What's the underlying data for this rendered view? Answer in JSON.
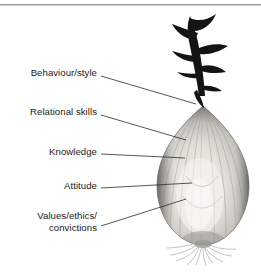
{
  "figure": {
    "background_color": "#ffffff",
    "rule_color": "#9a9a9a",
    "text_color": "#1b1b1b",
    "leader_color": "#2b2b2b"
  },
  "labels": [
    {
      "id": "behaviour-style",
      "text": "Behaviour/style",
      "right_px": 164,
      "top_px": 67,
      "leader": {
        "x1": 101,
        "y1": 76,
        "x2": 196,
        "y2": 104
      }
    },
    {
      "id": "relational-skills",
      "text": "Relational skills",
      "right_px": 164,
      "top_px": 106,
      "leader": {
        "x1": 101,
        "y1": 115,
        "x2": 186,
        "y2": 140
      }
    },
    {
      "id": "knowledge",
      "text": "Knowledge",
      "right_px": 164,
      "top_px": 146,
      "leader": {
        "x1": 101,
        "y1": 154,
        "x2": 185,
        "y2": 158
      }
    },
    {
      "id": "attitude",
      "text": "Attitude",
      "right_px": 164,
      "top_px": 180,
      "leader": {
        "x1": 101,
        "y1": 188,
        "x2": 192,
        "y2": 183
      }
    },
    {
      "id": "values-ethics-convictions",
      "text": "Values/ethics/\nconvictions",
      "right_px": 164,
      "top_px": 210,
      "leader": {
        "x1": 101,
        "y1": 226,
        "x2": 186,
        "y2": 199
      }
    }
  ],
  "onion": {
    "name": "onion-photo",
    "description": "Grayscale photograph of an onion bulb with dried dark stalk on top and wispy roots below",
    "bulb": {
      "cx": 203,
      "cy": 180,
      "rx": 46,
      "ry": 66
    },
    "stalk": {
      "x": 175,
      "y": 14,
      "width": 42,
      "height": 78,
      "color": "#141414"
    },
    "roots": {
      "x": 168,
      "y": 226,
      "width": 72,
      "height": 32,
      "color": "#b6b6b6"
    },
    "skin_light": "#e9e7e1",
    "skin_mid": "#c3c1ba",
    "skin_dark": "#6e6c68"
  }
}
